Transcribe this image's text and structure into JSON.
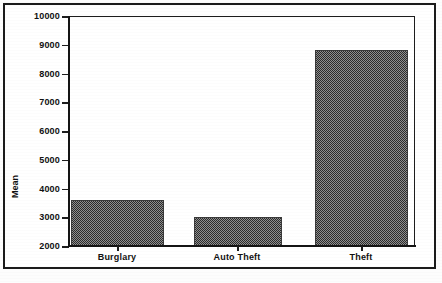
{
  "chart_data": {
    "type": "bar",
    "title": "",
    "subtitle": "",
    "xlabel": "",
    "ylabel": "Mean",
    "categories": [
      "Burglary",
      "Auto Theft",
      "Theft"
    ],
    "values": [
      3570,
      2960,
      8800
    ],
    "series": [
      {
        "name": "Mean",
        "values": [
          3570,
          2960,
          8800
        ]
      }
    ],
    "ylim": [
      2000,
      10000
    ],
    "ytick_labels": [
      "10000",
      "9000",
      "8000",
      "7000",
      "6000",
      "5000",
      "4000",
      "3000",
      "2000"
    ],
    "ytick_values": [
      10000,
      9000,
      8000,
      7000,
      6000,
      5000,
      4000,
      3000,
      2000
    ],
    "ytick_step": 1000,
    "grid": false,
    "legend": false,
    "legend_position": "none",
    "bar_fill": "50% checkerboard dither pattern",
    "bar_fill_color": "#2b2b2b",
    "axis_color": "#141414",
    "background_color": "#ffffff",
    "annotations": []
  },
  "figure": {
    "border_color": "#1b1b1b",
    "frame_label": "chart-outer-border"
  }
}
